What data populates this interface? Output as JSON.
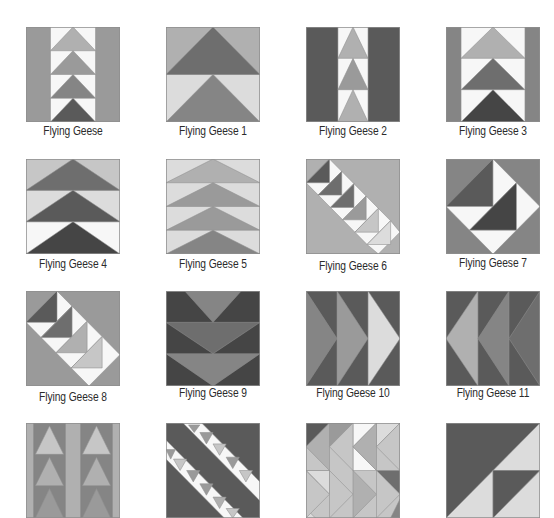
{
  "palette": {
    "white": "#f7f7f7",
    "lightest": "#dcdcdc",
    "light": "#c6c6c6",
    "midlight": "#b0b0b0",
    "mid": "#9a9a9a",
    "middark": "#858585",
    "dark": "#6e6e6e",
    "darker": "#5a5a5a",
    "darkest": "#454545",
    "outline": "#8f8f8f"
  },
  "blocks": [
    {
      "label": "Flying Geese",
      "x": 26,
      "y": 27,
      "label_y": 124,
      "shapes": [
        {
          "p": "0,0 100,0 100,100 0,100",
          "c": "mid"
        },
        {
          "p": "26,0 74,0 74,100 26,100",
          "c": "white"
        },
        {
          "p": "26,25 50,0 74,25",
          "c": "midlight"
        },
        {
          "p": "26,50 50,25 74,50",
          "c": "mid"
        },
        {
          "p": "26,75 50,50 74,75",
          "c": "middark"
        },
        {
          "p": "26,100 50,75 74,100",
          "c": "darker"
        }
      ]
    },
    {
      "label": "Flying Geese 1",
      "x": 166,
      "y": 27,
      "label_y": 124,
      "shapes": [
        {
          "p": "0,0 100,0 100,50 0,50",
          "c": "midlight"
        },
        {
          "p": "0,50 100,50 100,100 0,100",
          "c": "lightest"
        },
        {
          "p": "0,50 50,0 100,50",
          "c": "dark"
        },
        {
          "p": "0,100 50,50 100,100",
          "c": "middark"
        }
      ]
    },
    {
      "label": "Flying Geese 2",
      "x": 306,
      "y": 27,
      "label_y": 124,
      "shapes": [
        {
          "p": "0,0 100,0 100,100 0,100",
          "c": "darker"
        },
        {
          "p": "34,0 66,0 66,100 34,100",
          "c": "white"
        },
        {
          "p": "34,33 50,0 66,33",
          "c": "midlight"
        },
        {
          "p": "34,66 50,33 66,66",
          "c": "mid"
        },
        {
          "p": "34,100 50,66 66,100",
          "c": "midlight"
        }
      ]
    },
    {
      "label": "Flying Geese 3",
      "x": 446,
      "y": 27,
      "label_y": 124,
      "shapes": [
        {
          "p": "0,0 100,0 100,100 0,100",
          "c": "middark"
        },
        {
          "p": "16,0 84,0 84,100 16,100",
          "c": "white"
        },
        {
          "p": "16,33 50,0 84,33",
          "c": "midlight"
        },
        {
          "p": "16,66 50,33 84,66",
          "c": "dark"
        },
        {
          "p": "16,100 50,66 84,100",
          "c": "darkest"
        }
      ]
    },
    {
      "label": "Flying Geese 4",
      "x": 26,
      "y": 159,
      "label_y": 257,
      "shapes": [
        {
          "p": "0,0 100,0 100,33 0,33",
          "c": "light"
        },
        {
          "p": "0,33 100,33 100,66 0,66",
          "c": "lightest"
        },
        {
          "p": "0,66 100,66 100,100 0,100",
          "c": "white"
        },
        {
          "p": "0,33 50,0 100,33",
          "c": "dark"
        },
        {
          "p": "0,66 50,33 100,66",
          "c": "darker"
        },
        {
          "p": "0,100 50,66 100,100",
          "c": "darkest"
        }
      ]
    },
    {
      "label": "Flying Geese 5",
      "x": 166,
      "y": 159,
      "label_y": 257,
      "shapes": [
        {
          "p": "0,0 100,0 100,100 0,100",
          "c": "lightest"
        },
        {
          "p": "0,25 50,0 100,25",
          "c": "midlight"
        },
        {
          "p": "0,50 50,25 100,50",
          "c": "mid"
        },
        {
          "p": "0,75 50,50 100,75",
          "c": "mid"
        },
        {
          "p": "0,100 50,75 100,100",
          "c": "middark"
        }
      ]
    },
    {
      "label": "Flying Geese 6",
      "x": 306,
      "y": 159,
      "label_y": 259,
      "shapes": [
        {
          "p": "0,0 100,0 100,100 0,100",
          "c": "midlight"
        },
        {
          "p": "0,25 25,0 38,13 13,38",
          "c": "white"
        },
        {
          "p": "0,25 25,0 25,25",
          "c": "darker"
        },
        {
          "p": "13,38 38,13 51,26 26,51",
          "c": "white"
        },
        {
          "p": "13,38 38,13 38,38",
          "c": "dark"
        },
        {
          "p": "26,51 51,26 64,39 39,64",
          "c": "white"
        },
        {
          "p": "26,51 51,26 51,51",
          "c": "dark"
        },
        {
          "p": "39,64 64,39 77,52 52,77",
          "c": "white"
        },
        {
          "p": "39,64 64,39 64,64",
          "c": "mid"
        },
        {
          "p": "52,77 77,52 90,65 65,90",
          "c": "white"
        },
        {
          "p": "52,77 77,52 77,77",
          "c": "light"
        },
        {
          "p": "65,90 90,65 100,77 77,100",
          "c": "white"
        },
        {
          "p": "65,90 90,65 90,90",
          "c": "lightest"
        }
      ]
    },
    {
      "label": "Flying Geese 7",
      "x": 446,
      "y": 159,
      "label_y": 256,
      "shapes": [
        {
          "p": "0,0 100,0 100,100 0,100",
          "c": "middark"
        },
        {
          "p": "0,50 50,0 50,50",
          "c": "darker"
        },
        {
          "p": "50,0 75,25 50,50",
          "c": "white"
        },
        {
          "p": "0,50 50,50 25,75",
          "c": "white"
        },
        {
          "p": "25,75 75,25 75,75",
          "c": "darkest"
        },
        {
          "p": "75,25 100,50 75,75",
          "c": "white"
        },
        {
          "p": "25,75 75,75 50,100",
          "c": "white"
        }
      ]
    },
    {
      "label": "Flying Geese 8",
      "x": 26,
      "y": 291,
      "label_y": 390,
      "shapes": [
        {
          "p": "0,0 100,0 100,100 0,100",
          "c": "mid"
        },
        {
          "p": "0,33 33,0 49,16 16,49",
          "c": "white"
        },
        {
          "p": "0,33 33,0 33,33",
          "c": "darker"
        },
        {
          "p": "16,49 49,16 65,32 32,65",
          "c": "white"
        },
        {
          "p": "16,49 49,16 49,49",
          "c": "dark"
        },
        {
          "p": "32,65 65,32 81,48 48,81",
          "c": "white"
        },
        {
          "p": "32,65 65,32 65,65",
          "c": "midlight"
        },
        {
          "p": "48,81 81,48 100,67 67,100",
          "c": "white"
        },
        {
          "p": "48,81 81,48 81,81",
          "c": "light"
        }
      ]
    },
    {
      "label": "Flying Geese 9",
      "x": 166,
      "y": 291,
      "label_y": 386,
      "shapes": [
        {
          "p": "0,0 100,0 100,100 0,100",
          "c": "darkest"
        },
        {
          "p": "20,0 80,0 50,33",
          "c": "middark"
        },
        {
          "p": "0,33 100,33 50,66",
          "c": "dark"
        },
        {
          "p": "0,66 100,66 50,100",
          "c": "middark"
        },
        {
          "p": "0,0 20,0 0,0",
          "c": "darkest"
        }
      ]
    },
    {
      "label": "Flying Geese 10",
      "x": 306,
      "y": 291,
      "label_y": 386,
      "shapes": [
        {
          "p": "0,0 100,0 100,100 0,100",
          "c": "darker"
        },
        {
          "p": "0,0 33,50 0,100",
          "c": "middark"
        },
        {
          "p": "33,0 66,50 33,100",
          "c": "mid"
        },
        {
          "p": "66,0 100,50 66,100",
          "c": "lightest"
        }
      ]
    },
    {
      "label": "Flying Geese 11",
      "x": 446,
      "y": 291,
      "label_y": 386,
      "shapes": [
        {
          "p": "0,0 100,0 100,100 0,100",
          "c": "darker"
        },
        {
          "p": "34,0 0,50 34,100",
          "c": "midlight"
        },
        {
          "p": "67,0 34,50 67,100",
          "c": "middark"
        },
        {
          "p": "100,0 67,50 100,100",
          "c": "dark"
        }
      ]
    },
    {
      "label": "",
      "x": 26,
      "y": 423,
      "label_y": 0,
      "shapes": [
        {
          "p": "0,0 100,0 100,100 0,100",
          "c": "midlight"
        },
        {
          "p": "8,0 42,0 42,100 8,100",
          "c": "middark"
        },
        {
          "p": "58,0 92,0 92,100 58,100",
          "c": "middark"
        },
        {
          "p": "10,33 25,3 40,33",
          "c": "light"
        },
        {
          "p": "60,33 75,3 90,33",
          "c": "light"
        },
        {
          "p": "10,66 25,36 40,66",
          "c": "midlight"
        },
        {
          "p": "60,66 75,36 90,66",
          "c": "midlight"
        },
        {
          "p": "10,100 25,69 40,100",
          "c": "mid"
        },
        {
          "p": "60,100 75,69 90,100",
          "c": "mid"
        }
      ]
    },
    {
      "label": "",
      "x": 166,
      "y": 423,
      "label_y": 0,
      "shapes": [
        {
          "p": "0,0 100,0 100,100 0,100",
          "c": "darker"
        },
        {
          "p": "18,0 38,0 100,62 100,82",
          "c": "white"
        },
        {
          "p": "0,18 0,38 62,100 82,100",
          "c": "white"
        },
        {
          "p": "24,2 36,2 30,10",
          "c": "mid"
        },
        {
          "p": "36,10 50,10 43,22",
          "c": "mid"
        },
        {
          "p": "50,22 64,22 57,34",
          "c": "light"
        },
        {
          "p": "64,36 78,36 71,48",
          "c": "mid"
        },
        {
          "p": "78,50 92,50 85,62",
          "c": "light"
        },
        {
          "p": "0,28 10,28 5,38",
          "c": "mid"
        },
        {
          "p": "8,38 22,38 15,50",
          "c": "light"
        },
        {
          "p": "22,50 36,50 29,62",
          "c": "mid"
        },
        {
          "p": "36,64 50,64 43,76",
          "c": "mid"
        },
        {
          "p": "50,78 64,78 57,90",
          "c": "midlight"
        },
        {
          "p": "64,90 78,90 71,100",
          "c": "light"
        }
      ]
    },
    {
      "label": "",
      "x": 306,
      "y": 423,
      "label_y": 0,
      "shapes": [
        {
          "p": "0,0 100,0 100,100 0,100",
          "c": "light"
        },
        {
          "p": "0,0 25,0 0,25",
          "c": "darker"
        },
        {
          "p": "0,75 25,50 0,50",
          "c": "dark"
        },
        {
          "p": "25,0 50,0 25,25",
          "c": "mid"
        },
        {
          "p": "50,0 75,0 50,25",
          "c": "white"
        },
        {
          "p": "50,50 75,50 50,25",
          "c": "white"
        },
        {
          "p": "75,0 100,0 75,25",
          "c": "lightest"
        },
        {
          "p": "0,50 25,50 25,75",
          "c": "lightest"
        },
        {
          "p": "75,50 100,50 100,75",
          "c": "dark"
        },
        {
          "p": "100,100 100,80 90,100",
          "c": "middark"
        },
        {
          "p": "0,100 10,100 0,90",
          "c": "lightest"
        },
        {
          "p": "0,25 25,0 25,50",
          "c": "midlight"
        },
        {
          "p": "25,25 50,0 50,50",
          "c": "light"
        },
        {
          "p": "50,25 75,0 75,50",
          "c": "midlight"
        },
        {
          "p": "75,25 100,0 100,50",
          "c": "light"
        },
        {
          "p": "0,50 25,75 0,100",
          "c": "light"
        },
        {
          "p": "25,50 50,75 25,100",
          "c": "light"
        },
        {
          "p": "50,50 75,75 50,100",
          "c": "midlight"
        },
        {
          "p": "75,50 100,75 75,100",
          "c": "light"
        }
      ]
    },
    {
      "label": "",
      "x": 446,
      "y": 423,
      "label_y": 0,
      "shapes": [
        {
          "p": "0,0 100,0 100,100 0,100",
          "c": "darker"
        },
        {
          "p": "100,0 100,50 50,50",
          "c": "lightest"
        },
        {
          "p": "0,100 50,50 50,100",
          "c": "lightest"
        },
        {
          "p": "50,50 100,50 50,100",
          "c": "darker"
        },
        {
          "p": "100,50 100,100 50,100",
          "c": "lightest"
        }
      ]
    }
  ]
}
